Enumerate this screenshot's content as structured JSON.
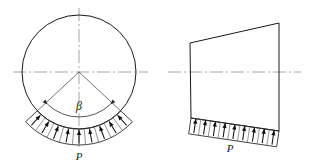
{
  "figure": {
    "background_color": "#ffffff",
    "line_color": "#1a1a1a",
    "centerline_color": "#8e8e8e",
    "width": 311,
    "height": 168
  },
  "left_diagram": {
    "name": "circular-section-with-radial-pressure",
    "circle": {
      "center_x": 79,
      "center_y": 72,
      "radius": 57
    },
    "angle_label": "β",
    "angle_label_x": 79,
    "angle_label_y": 110,
    "angle_span_degrees": 94,
    "half_angle_degrees": 47,
    "load_label": "P",
    "load_label_x": 79,
    "load_label_y": 160,
    "load_band_thickness": 16,
    "arrow_count": 9,
    "centerline_horizontal": {
      "x1": 13,
      "y1": 72,
      "x2": 148,
      "y2": 72
    },
    "centerline_vertical": {
      "x1": 79,
      "y1": 8,
      "x2": 79,
      "y2": 150
    }
  },
  "right_diagram": {
    "name": "tapered-block-with-distributed-pressure",
    "corners": {
      "top_left_x": 190,
      "top_left_y": 43,
      "top_right_x": 279,
      "top_right_y": 23,
      "bottom_right_x": 279,
      "bottom_right_y": 131,
      "bottom_left_x": 191,
      "bottom_left_y": 118
    },
    "load_label": "P",
    "load_label_x": 230,
    "load_label_y": 152,
    "load_band_thickness": 16,
    "arrow_count": 9,
    "centerline_horizontal": {
      "x1": 168,
      "y1": 72,
      "x2": 301,
      "y2": 72
    }
  }
}
